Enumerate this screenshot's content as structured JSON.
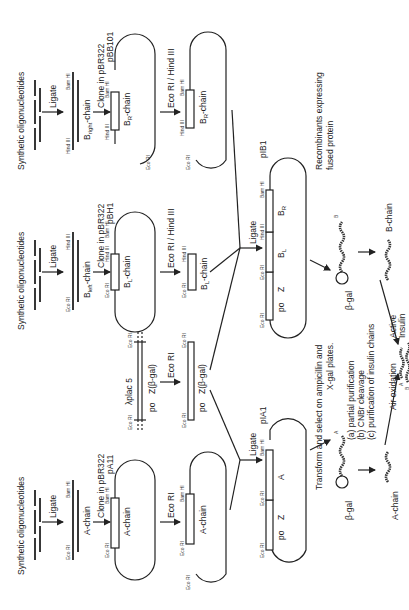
{
  "figure": {
    "orientation": "rotated 90 degrees counter-clockwise",
    "columns": {
      "a_chain": {
        "start_label": "Synthetic oligonucleotides",
        "step1": "Ligate",
        "fragment_label": "A-chain",
        "fragment_left_site": "Eco RI",
        "fragment_right_site": "Bam HI",
        "step2": "Clone in pBR322",
        "plasmid_name": "pA11",
        "insert_label": "A-chain",
        "insert_left_site": "Eco RI",
        "insert_right_site": "Bam HI",
        "step3": "Eco RI",
        "cut_insert_label": "A-chain",
        "cut_left_site": "Eco RI",
        "cut_right_site": "Bam HI",
        "cut_end_site": "Eco RI"
      },
      "lplac": {
        "source_label": "λplac 5",
        "left_site": "Eco RI",
        "right_site": "Eco RI",
        "segment_label_po": "po",
        "segment_label_z": "Z(β-gal)",
        "step": "Eco RI",
        "fragment_left_site": "Eco RI",
        "fragment_right_site": "Eco RI",
        "fragment_po": "po",
        "fragment_z": "Z(β-gal)"
      },
      "b_left": {
        "start_label": "Synthetic oligonucleotides",
        "step1": "Ligate",
        "fragment_label": "B",
        "fragment_label_sub": "left",
        "fragment_label_suffix": "-chain",
        "fragment_left_site": "Eco RI",
        "fragment_right_site": "Hind III",
        "step2": "Clone in pBR322",
        "plasmid_name": "pBH1",
        "insert_label": "B",
        "insert_label_sub": "L",
        "insert_label_suffix": "-chain",
        "insert_left_site": "Eco RI",
        "insert_mid_site": "Hind III",
        "insert_right_site": "Bam HI",
        "step3": "Eco RI / Hind III",
        "cut_label": "B",
        "cut_label_sub": "L",
        "cut_label_suffix": "-chain",
        "cut_left_site": "Eco RI",
        "cut_right_site": "Hind III"
      },
      "b_right": {
        "start_label": "Synthetic oligonucleotides",
        "step1": "Ligate",
        "fragment_label": "B",
        "fragment_label_sub": "right",
        "fragment_label_suffix": "-chain",
        "fragment_left_site": "Hind III",
        "fragment_right_site": "Bam HI",
        "step2": "Clone in pBR322",
        "plasmid_name": "pBB101",
        "insert_label": "B",
        "insert_label_sub": "R",
        "insert_label_suffix": "-chain",
        "insert_left_site": "Hind III",
        "insert_right_site": "Bam HI",
        "insert_end_site": "Eco RI",
        "step3": "Eco RI / Hind III",
        "cut_label": "B",
        "cut_label_sub": "R",
        "cut_label_suffix": "-chain",
        "cut_left_site": "Hind III",
        "cut_right_site": "Bam HI",
        "cut_end_site": "Eco RI"
      }
    },
    "ligate_a": "Ligate",
    "ligate_b": "Ligate",
    "plasmid_pia1": {
      "name": "pIA1",
      "sites": [
        "Eco RI",
        "Eco RI",
        "Bam HI"
      ],
      "segments": [
        "po",
        "Z",
        "A"
      ]
    },
    "plasmid_pib1": {
      "name": "pIB1",
      "sites": [
        "Eco RI",
        "Eco RI",
        "Hind III",
        "Bam HI"
      ],
      "segments": [
        "po",
        "Z",
        "B",
        "B"
      ],
      "segment_subs": [
        "",
        "",
        "L",
        "R"
      ]
    },
    "transform_text": [
      "Transform and select on ampicillin and",
      "X-gal plates."
    ],
    "recombinants_text": [
      "Recombinants expressing",
      "fused protein"
    ],
    "protein_a": {
      "bgal": "β-gal",
      "chain": "A"
    },
    "protein_b": {
      "bgal": "β-gal",
      "chain": "B"
    },
    "processing_steps": [
      "(a) partial purification",
      "(b) CNBr cleavage",
      "(c) purification of insulin chains"
    ],
    "a_chain_label": "A-chain",
    "b_chain_label": "B-chain",
    "air_oxidation": "Air oxidation",
    "active_insulin": [
      "Active",
      "Insulin"
    ],
    "insulin_chain_labels": [
      "A",
      "B"
    ]
  }
}
